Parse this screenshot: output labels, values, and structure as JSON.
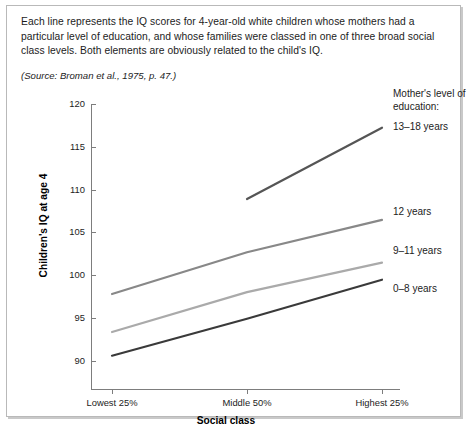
{
  "caption": {
    "body": "Each line represents the IQ scores for 4-year-old white children whose mothers had a particular level of education, and whose families were classed in one of three broad social class levels. Both elements are obviously related to the child's IQ.",
    "source": "(Source: Broman et al., 1975, p. 47.)"
  },
  "legend": {
    "title": "Mother's level of education:"
  },
  "chart_data": {
    "type": "line",
    "title": "",
    "xlabel": "Social class",
    "ylabel": "Children's IQ at age 4",
    "categories": [
      "Lowest 25%",
      "Middle 50%",
      "Highest 25%"
    ],
    "ylim": [
      90,
      120
    ],
    "yticks": [
      90,
      95,
      100,
      105,
      110,
      115,
      120
    ],
    "ytick_labels": [
      "90",
      "95",
      "100",
      "105",
      "110",
      "115",
      "120"
    ],
    "grid": false,
    "legend_position": "right-inline",
    "series": [
      {
        "name": "13–18 years",
        "color": "#555555",
        "values": [
          null,
          110.0,
          117.5
        ]
      },
      {
        "name": "12 years",
        "color": "#888888",
        "values": [
          100.0,
          104.4,
          107.8
        ]
      },
      {
        "name": "9–11 years",
        "color": "#aaaaaa",
        "values": [
          96.0,
          100.2,
          103.3
        ]
      },
      {
        "name": "0–8 years",
        "color": "#3a3a3a",
        "values": [
          93.5,
          97.4,
          101.5
        ]
      }
    ]
  }
}
